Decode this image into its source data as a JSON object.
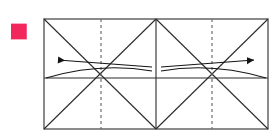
{
  "figure": {
    "kind": "origami-fold-step-diagram",
    "step_badge": {
      "number": "6",
      "background_color": "#F2275B",
      "text_color": "#FFFFFF",
      "shape": "square"
    },
    "canvas": {
      "width": 278,
      "height": 140,
      "background_color": "#FFFFFF"
    },
    "paper": {
      "outline_color": "#5A5A5A",
      "fill_color": "#FFFFFF",
      "x": 44,
      "y": 19,
      "width": 224,
      "height": 110,
      "description": "wide rectangle made of two adjoining squares"
    },
    "crease_lines": {
      "solid_color": "#2B2B2B",
      "dashed_color": "#6E6E6E",
      "solid": [
        {
          "name": "center-vertical",
          "x1": 156,
          "y1": 19,
          "x2": 156,
          "y2": 129
        },
        {
          "name": "horizontal-midline",
          "x1": 44,
          "y1": 78,
          "x2": 268,
          "y2": 78
        },
        {
          "name": "left-square-diagonal-down",
          "x1": 44,
          "y1": 19,
          "x2": 156,
          "y2": 129
        },
        {
          "name": "left-square-diagonal-up",
          "x1": 44,
          "y1": 129,
          "x2": 156,
          "y2": 19
        },
        {
          "name": "right-square-diagonal-down",
          "x1": 156,
          "y1": 19,
          "x2": 268,
          "y2": 129
        },
        {
          "name": "right-square-diagonal-up",
          "x1": 156,
          "y1": 129,
          "x2": 268,
          "y2": 19
        }
      ],
      "dashed": [
        {
          "name": "left-square-vertical-bisector",
          "x1": 101,
          "y1": 19,
          "x2": 101,
          "y2": 129
        },
        {
          "name": "right-square-vertical-bisector",
          "x1": 212,
          "y1": 19,
          "x2": 212,
          "y2": 129
        }
      ]
    },
    "fold_arrows": [
      {
        "name": "left-fold-arrow",
        "direction": "left",
        "head_x": 58,
        "head_y": 60,
        "tail_x": 152,
        "tail_y": 67,
        "color": "#141414"
      },
      {
        "name": "right-fold-arrow",
        "direction": "right",
        "head_x": 254,
        "head_y": 60,
        "tail_x": 161,
        "tail_y": 67,
        "color": "#141414"
      }
    ],
    "fold_arcs": [
      {
        "name": "left-fold-arc",
        "start_x": 46,
        "start_y": 78,
        "control_x": 100,
        "control_y": 62,
        "end_x": 152,
        "end_y": 71,
        "color": "#141414"
      },
      {
        "name": "right-fold-arc",
        "start_x": 266,
        "start_y": 78,
        "control_x": 212,
        "control_y": 62,
        "end_x": 161,
        "end_y": 71,
        "color": "#141414"
      }
    ]
  }
}
